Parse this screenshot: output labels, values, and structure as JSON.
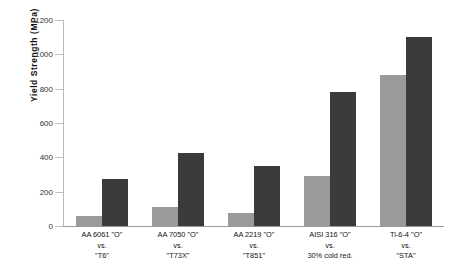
{
  "chart_data": {
    "type": "bar",
    "title": "",
    "xlabel": "",
    "ylabel": "Yield  Strength  (MPa)",
    "ylim": [
      0,
      1200
    ],
    "yticks": [
      0,
      200,
      400,
      600,
      800,
      1000,
      1200
    ],
    "ytick_labels": [
      "0",
      "200",
      "400",
      "600",
      "800",
      "1000",
      "1200"
    ],
    "grid": false,
    "legend": "none",
    "categories": [
      "AA 6061 \"O\"\nvs.\n\"T6\"",
      "AA 7050 \"O\"\nvs.\n\"T73X\"",
      "AA 2219 \"O\"\nvs.\n\"T851\"",
      "AISI 316 \"O\"\nvs.\n30% cold red.",
      "Ti-6-4 \"O\"\nvs.\n\"STA\""
    ],
    "category_lines": [
      [
        "AA 6061  \"O\"",
        "vs.",
        "\"T6\""
      ],
      [
        "AA 7050 \"O\"",
        "vs.",
        "\"T73X\""
      ],
      [
        "AA 2219 \"O\"",
        "vs.",
        "\"T851\""
      ],
      [
        "AISI 316 \"O\"",
        "vs.",
        "30% cold red."
      ],
      [
        "Ti-6-4 \"O\"",
        "vs.",
        "\"STA\""
      ]
    ],
    "series": [
      {
        "name": "Annealed \"O\"",
        "color": "#9a9a9a",
        "values": [
          58,
          110,
          76,
          290,
          880
        ]
      },
      {
        "name": "Tempered / hardened",
        "color": "#3a3a3a",
        "values": [
          274,
          428,
          348,
          780,
          1100
        ]
      }
    ]
  }
}
